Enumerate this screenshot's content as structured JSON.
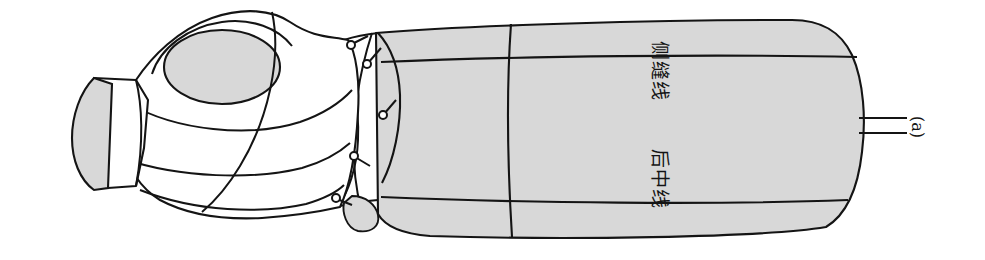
{
  "figure": {
    "caption": "(a)",
    "background_color": "#ffffff",
    "line_color": "#141414",
    "fill_gray": "#d8d8d8",
    "fill_white": "#ffffff",
    "orientation_note": "rotated-90"
  },
  "labels": {
    "side_seam": "侧缝线",
    "back_center": "后中线",
    "panel_a": "(a)"
  },
  "geometry": {
    "neck_stump": {
      "name": "neck-stump",
      "fill": "#d8d8d8"
    },
    "armhole_ellipse": {
      "name": "armhole-ellipse",
      "cx": 222,
      "cy": 67,
      "rx": 58,
      "ry": 37,
      "fill": "#d8d8d8"
    },
    "pins": [
      {
        "cx": 352,
        "cy": 44,
        "r": 4
      },
      {
        "cx": 368,
        "cy": 63,
        "r": 4
      },
      {
        "cx": 383,
        "cy": 113,
        "r": 4
      },
      {
        "cx": 354,
        "cy": 156,
        "r": 4
      },
      {
        "cx": 336,
        "cy": 199,
        "r": 4
      }
    ],
    "leader_lines": [
      {
        "x1": 860,
        "y1": 118,
        "x2": 905,
        "y2": 118
      },
      {
        "x1": 860,
        "y1": 133,
        "x2": 905,
        "y2": 133
      }
    ]
  }
}
